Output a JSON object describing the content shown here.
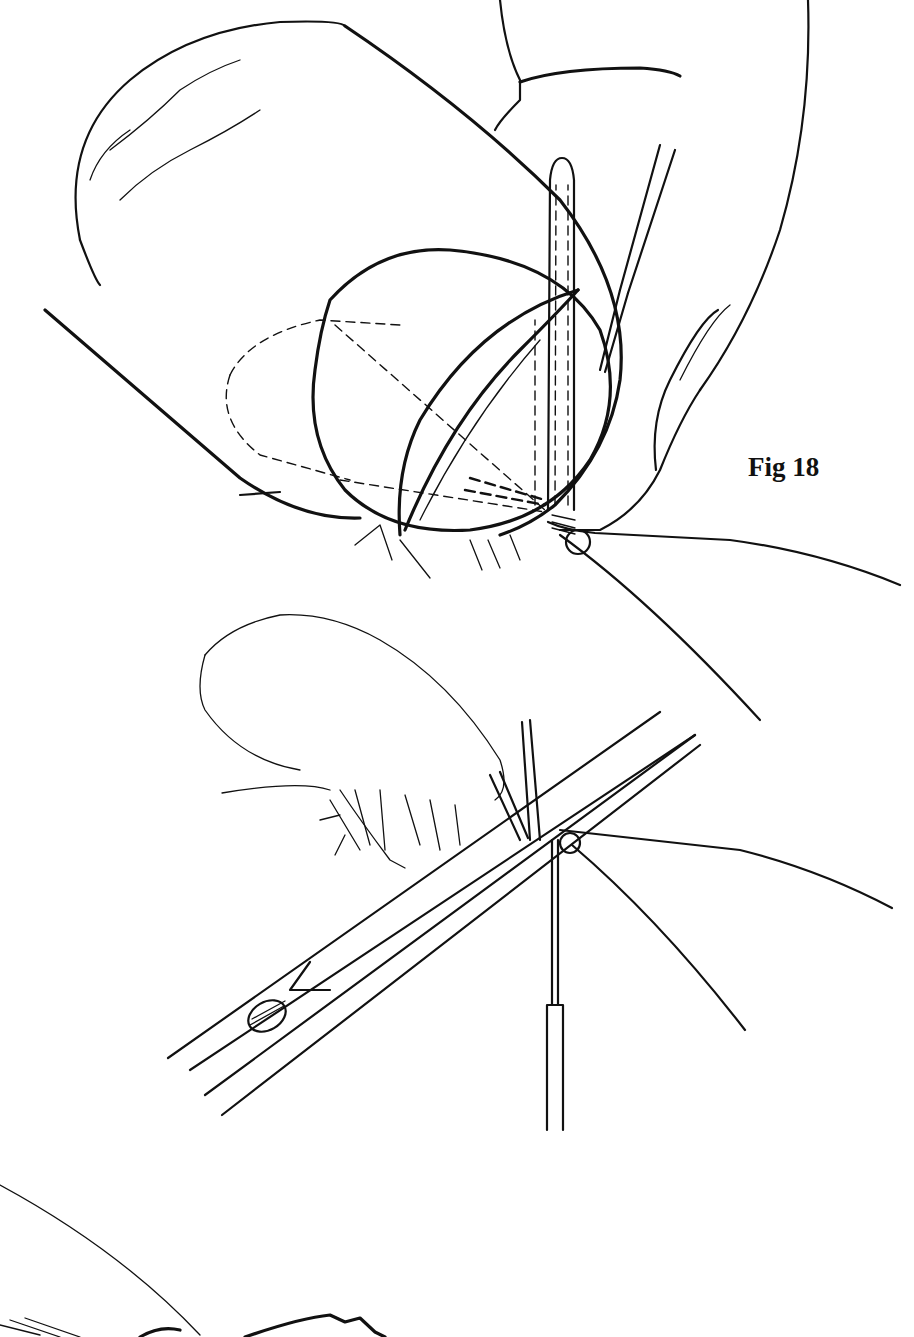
{
  "figure": {
    "caption": "Fig 18",
    "background": "#ffffff",
    "ink_color": "#111111"
  },
  "panels": [
    {
      "name": "top",
      "subject": "thumb and finger holding wing fibers with thread loop over hook"
    },
    {
      "name": "middle",
      "subject": "scissors trimming fibers at hook with bobbin tube"
    },
    {
      "name": "bottom",
      "subject": "partial feathered fly wing"
    }
  ]
}
